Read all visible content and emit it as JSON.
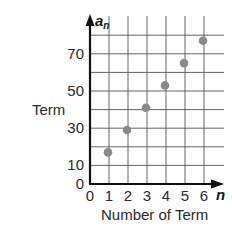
{
  "chart_data": {
    "type": "scatter",
    "title": "",
    "xlabel": "Number of Term",
    "ylabel": "Term",
    "x_var": "n",
    "y_var": "a",
    "y_var_sub": "n",
    "x_ticks": [
      "0",
      "1",
      "2",
      "3",
      "4",
      "5",
      "6"
    ],
    "y_ticks": [
      "0",
      "10",
      "30",
      "50",
      "70"
    ],
    "xlim": [
      0,
      6
    ],
    "ylim": [
      0,
      80
    ],
    "grid": true,
    "x": [
      1,
      2,
      3,
      4,
      5,
      6
    ],
    "y": [
      17,
      29,
      41,
      53,
      65,
      77
    ],
    "point_color": "#8a8a8a"
  }
}
